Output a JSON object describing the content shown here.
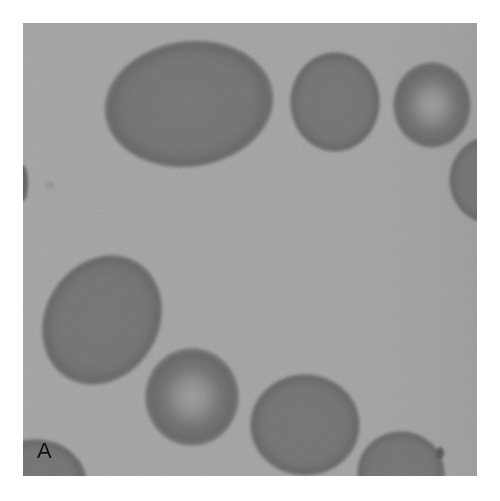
{
  "figure": {
    "panel_label": "A",
    "colors": {
      "background": "#acacac",
      "cell_fill": "#7c7c7c",
      "cell_rim": "#6f6f6f",
      "central_pallor": "#a0a0a0",
      "label": "#111111"
    },
    "cells": [
      {
        "id": "large-oval-top",
        "cx": 166,
        "cy": 81,
        "rx": 85,
        "ry": 63,
        "rotate": -8,
        "pallor": false
      },
      {
        "id": "round-top-middle",
        "cx": 312,
        "cy": 79,
        "rx": 45,
        "ry": 50,
        "rotate": 0,
        "pallor": false
      },
      {
        "id": "round-top-right",
        "cx": 409,
        "cy": 82,
        "rx": 39,
        "ry": 43,
        "rotate": 0,
        "pallor": true
      },
      {
        "id": "partial-right-edge",
        "cx": 468,
        "cy": 157,
        "rx": 42,
        "ry": 44,
        "rotate": 0,
        "pallor": false
      },
      {
        "id": "oval-lower-left",
        "cx": 79,
        "cy": 297,
        "rx": 57,
        "ry": 68,
        "rotate": 32,
        "pallor": false
      },
      {
        "id": "round-bottom-pallor",
        "cx": 169,
        "cy": 374,
        "rx": 47,
        "ry": 49,
        "rotate": 0,
        "pallor": true
      },
      {
        "id": "round-bottom-middle",
        "cx": 282,
        "cy": 402,
        "rx": 55,
        "ry": 51,
        "rotate": 0,
        "pallor": false
      },
      {
        "id": "partial-bottom-right",
        "cx": 378,
        "cy": 450,
        "rx": 44,
        "ry": 42,
        "rotate": 0,
        "pallor": false
      },
      {
        "id": "partial-bottom-left",
        "cx": 12,
        "cy": 460,
        "rx": 52,
        "ry": 44,
        "rotate": 0,
        "pallor": false
      }
    ]
  }
}
